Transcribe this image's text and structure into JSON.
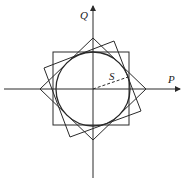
{
  "diagram": {
    "type": "PQ capability diagram",
    "axes": {
      "x_label": "P",
      "y_label": "Q",
      "origin": [
        93,
        89
      ]
    },
    "labels": {
      "radius_label": "S"
    },
    "shapes": {
      "circle": {
        "cx": 93,
        "cy": 89,
        "r": 37
      },
      "square": {
        "x1": 53,
        "y1": 52,
        "x2": 129,
        "y2": 125
      },
      "diamond": [
        [
          93,
          38
        ],
        [
          146,
          89
        ],
        [
          93,
          140
        ],
        [
          40,
          89
        ]
      ],
      "rotated_square": [
        [
          114,
          41
        ],
        [
          141,
          111
        ],
        [
          70,
          137
        ],
        [
          44,
          68
        ]
      ],
      "radius_line": {
        "from": [
          93,
          89
        ],
        "to": [
          128,
          77
        ],
        "style": "dashed"
      }
    },
    "colors": {
      "stroke": "#2a2a2a",
      "background": "#ffffff"
    }
  }
}
